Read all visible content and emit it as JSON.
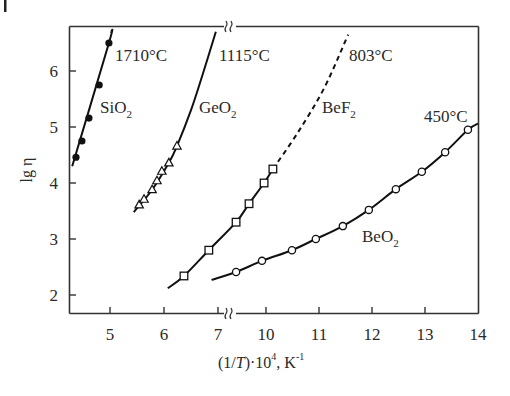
{
  "chart_data": {
    "type": "line",
    "title": "",
    "xlabel": "(1/T)·10^4, K^-1",
    "ylabel": "lg η",
    "xlim": [
      4.3,
      14
    ],
    "ylim": [
      1.7,
      6.85
    ],
    "axis_break_x": [
      7,
      10
    ],
    "grid": false,
    "legend": "none (series labeled inline)",
    "x_ticks": [
      5,
      6,
      7,
      10,
      11,
      12,
      13,
      14
    ],
    "y_ticks": [
      2,
      3,
      4,
      5,
      6
    ],
    "series": [
      {
        "name": "SiO2",
        "marker": "filled-circle",
        "line": "solid",
        "annotation": "1710°C",
        "x": [
          4.37,
          4.48,
          4.61,
          4.8,
          4.98
        ],
        "y": [
          4.46,
          4.75,
          5.16,
          5.75,
          6.5
        ],
        "curve": [
          [
            4.3,
            4.3
          ],
          [
            4.98,
            6.5
          ],
          [
            5.02,
            6.7
          ]
        ]
      },
      {
        "name": "GeO2",
        "marker": "open-triangle",
        "line": "solid",
        "annotation": "1115°C",
        "x": [
          5.54,
          5.63,
          5.78,
          5.87,
          5.96,
          6.09,
          6.24
        ],
        "y": [
          3.61,
          3.71,
          3.88,
          4.04,
          4.21,
          4.36,
          4.66
        ],
        "curve": [
          [
            5.44,
            3.48
          ],
          [
            5.78,
            3.88
          ],
          [
            6.09,
            4.36
          ],
          [
            6.24,
            4.66
          ],
          [
            6.5,
            5.3
          ],
          [
            6.72,
            5.95
          ],
          [
            6.96,
            6.7
          ]
        ]
      },
      {
        "name": "BeF2",
        "marker": "open-square",
        "line": "solid, dashed extrapolation",
        "annotation": "803°C",
        "x": [
          6.37,
          6.83,
          8.13,
          8.94,
          9.88,
          10.13
        ],
        "y": [
          2.34,
          2.8,
          3.3,
          3.63,
          4.0,
          4.25
        ],
        "curve": [
          [
            6.07,
            2.12
          ],
          [
            6.37,
            2.34
          ],
          [
            6.83,
            2.8
          ],
          [
            8.13,
            3.3
          ],
          [
            8.94,
            3.63
          ],
          [
            9.88,
            4.0
          ],
          [
            10.13,
            4.25
          ]
        ],
        "dashed_curve": [
          [
            10.13,
            4.25
          ],
          [
            10.6,
            4.9
          ],
          [
            11.1,
            5.7
          ],
          [
            11.55,
            6.65
          ]
        ]
      },
      {
        "name": "BeO2",
        "marker": "open-circle",
        "line": "solid",
        "annotation": "450°C",
        "x": [
          8.13,
          9.75,
          10.49,
          10.94,
          11.45,
          11.94,
          12.45,
          12.94,
          13.38,
          13.81
        ],
        "y": [
          2.41,
          2.61,
          2.8,
          3.0,
          3.23,
          3.52,
          3.89,
          4.2,
          4.55,
          4.95
        ],
        "curve": [
          [
            6.88,
            2.27
          ],
          [
            8.13,
            2.41
          ],
          [
            9.75,
            2.61
          ],
          [
            10.49,
            2.8
          ],
          [
            10.94,
            3.0
          ],
          [
            11.45,
            3.23
          ],
          [
            11.94,
            3.52
          ],
          [
            12.45,
            3.89
          ],
          [
            12.94,
            4.2
          ],
          [
            13.38,
            4.55
          ],
          [
            13.81,
            4.95
          ],
          [
            14.0,
            5.06
          ]
        ]
      }
    ]
  },
  "labels": {
    "ylabel_text": "lg η",
    "xlabel_pre": "(1/",
    "xlabel_T": "T",
    "xlabel_mid": ")·10",
    "xlabel_exp": "4",
    "xlabel_unit": ", K",
    "xlabel_unit_exp": "-1",
    "series_labels": [
      {
        "base": "SiO",
        "sub": "2"
      },
      {
        "base": "GeO",
        "sub": "2"
      },
      {
        "base": "BeF",
        "sub": "2"
      },
      {
        "base": "BeO",
        "sub": "2"
      }
    ],
    "temperature_labels": [
      "1710°C",
      "1115°C",
      "803°C",
      "450°C"
    ]
  }
}
